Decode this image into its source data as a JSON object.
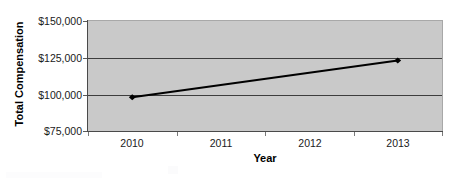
{
  "chart_data": {
    "type": "line",
    "title": "",
    "subtitle": "",
    "xlabel": "Year",
    "ylabel": "Total Compensation",
    "categories": [
      "2010",
      "2011",
      "2012",
      "2013"
    ],
    "x": [
      2010,
      2011,
      2012,
      2013
    ],
    "series": [
      {
        "name": "Total Compensation",
        "values": [
          98000,
          null,
          null,
          123000
        ],
        "points": [
          {
            "x": "2010",
            "y": 98000
          },
          {
            "x": "2013",
            "y": 123000
          }
        ],
        "color": "#000000",
        "marker": "diamond",
        "line_width": 2
      }
    ],
    "ylim": [
      75000,
      150000
    ],
    "y_ticks": [
      75000,
      100000,
      125000,
      150000
    ],
    "y_tick_labels": [
      "$75,000",
      "$100,000",
      "$125,000",
      "$150,000"
    ],
    "x_tick_labels": [
      "2010",
      "2011",
      "2012",
      "2013"
    ],
    "grid": true,
    "grid_axis": "y",
    "legend": false,
    "legend_position": "none",
    "plot_background": "#c9c9c9",
    "figure_background": "#ffffff",
    "axis_color": "#4a4a4a",
    "gridline_color": "#3d3d3d"
  },
  "axes": {
    "y_title": "Total Compensation",
    "x_title": "Year",
    "y_tick_labels": [
      "$150,000",
      "$125,000",
      "$100,000",
      "$75,000"
    ],
    "x_tick_labels": [
      "2010",
      "2011",
      "2012",
      "2013"
    ]
  }
}
